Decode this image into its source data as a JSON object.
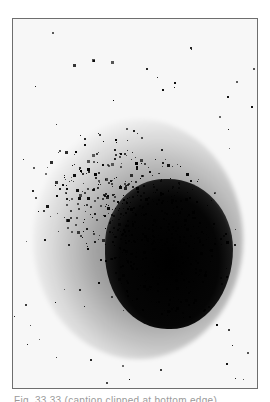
{
  "figure": {
    "frame_border_color": "#6e6e6e",
    "background_color": "#f7f7f7",
    "hot_region_color": "#000000"
  },
  "caption": {
    "text": "Fig. 33.33 (caption clipped at bottom edge)"
  }
}
